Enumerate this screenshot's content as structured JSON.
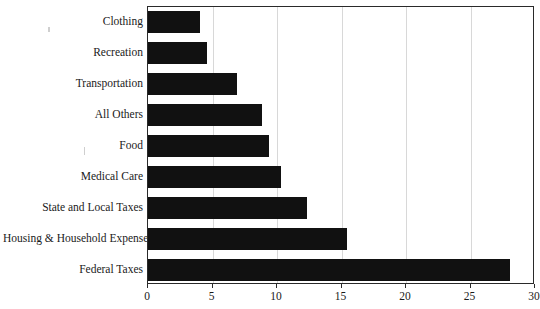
{
  "chart_data": {
    "type": "bar",
    "orientation": "horizontal",
    "title": "",
    "subtitle": "",
    "xlabel": "",
    "ylabel": "",
    "xlim": [
      0,
      30
    ],
    "ylim": null,
    "grid": true,
    "legend": null,
    "legend_position": "none",
    "bar_color": "#111111",
    "gridline_color": "#d8d8d8",
    "axis_color": "#2a2a2a",
    "background_color": "#ffffff",
    "xticks": [
      0,
      5,
      10,
      15,
      20,
      25,
      30
    ],
    "xticklabels": [
      "0",
      "5",
      "10",
      "15",
      "20",
      "25",
      "30"
    ],
    "categories": [
      "Clothing",
      "Recreation",
      "Transportation",
      "All Others",
      "Food",
      "Medical Care",
      "State and Local Taxes",
      "Housing & Household Expenses",
      "Federal Taxes"
    ],
    "values": [
      4.0,
      4.6,
      6.9,
      8.8,
      9.4,
      10.3,
      12.3,
      15.4,
      28.1
    ],
    "bars": [
      {
        "label": "Clothing",
        "value": 4.0
      },
      {
        "label": "Recreation",
        "value": 4.6
      },
      {
        "label": "Transportation",
        "value": 6.9
      },
      {
        "label": "All Others",
        "value": 8.8
      },
      {
        "label": "Food",
        "value": 9.4
      },
      {
        "label": "Medical Care",
        "value": 10.3
      },
      {
        "label": "State and Local Taxes",
        "value": 12.3
      },
      {
        "label": "Housing & Household Expenses",
        "value": 15.4
      },
      {
        "label": "Federal Taxes",
        "value": 28.1
      }
    ]
  }
}
